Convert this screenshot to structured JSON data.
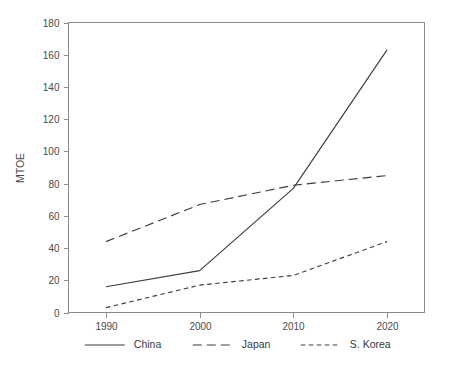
{
  "chart_data": {
    "type": "line",
    "title": "",
    "subtitle": "",
    "xlabel": "",
    "ylabel": "MTOE",
    "x": [
      1990,
      2000,
      2010,
      2020
    ],
    "xtick_labels": [
      "1990",
      "2000",
      "2010",
      "2020"
    ],
    "ytick_labels": [
      "0",
      "20",
      "40",
      "60",
      "80",
      "100",
      "120",
      "140",
      "160",
      "180"
    ],
    "ytick_values": [
      0,
      20,
      40,
      60,
      80,
      100,
      120,
      140,
      160,
      180
    ],
    "xlim": [
      1986,
      2024
    ],
    "ylim": [
      0,
      180
    ],
    "grid": false,
    "legend_position": "bottom",
    "series": [
      {
        "name": "China",
        "dash": "solid",
        "color": "#3c3c3c",
        "values": [
          16,
          26,
          77,
          163
        ]
      },
      {
        "name": "Japan",
        "dash": "long-dash",
        "color": "#3c3c3c",
        "values": [
          44,
          67,
          79,
          85
        ]
      },
      {
        "name": "S. Korea",
        "dash": "short-dash",
        "color": "#3c3c3c",
        "values": [
          3,
          17,
          23,
          44
        ]
      }
    ]
  },
  "axis": {
    "y_title": "MTOE",
    "y_ticks": [
      "0",
      "20",
      "40",
      "60",
      "80",
      "100",
      "120",
      "140",
      "160",
      "180"
    ],
    "x_ticks": [
      "1990",
      "2000",
      "2010",
      "2020"
    ]
  },
  "legend": {
    "items": [
      {
        "label": "China",
        "dash": "solid"
      },
      {
        "label": "Japan",
        "dash": "long-dash"
      },
      {
        "label": "S. Korea",
        "dash": "short-dash"
      }
    ]
  },
  "colors": {
    "ink": "#3c3c3c",
    "axis": "#8a8a8a",
    "text": "#4a4a4a",
    "background": "#ffffff"
  }
}
